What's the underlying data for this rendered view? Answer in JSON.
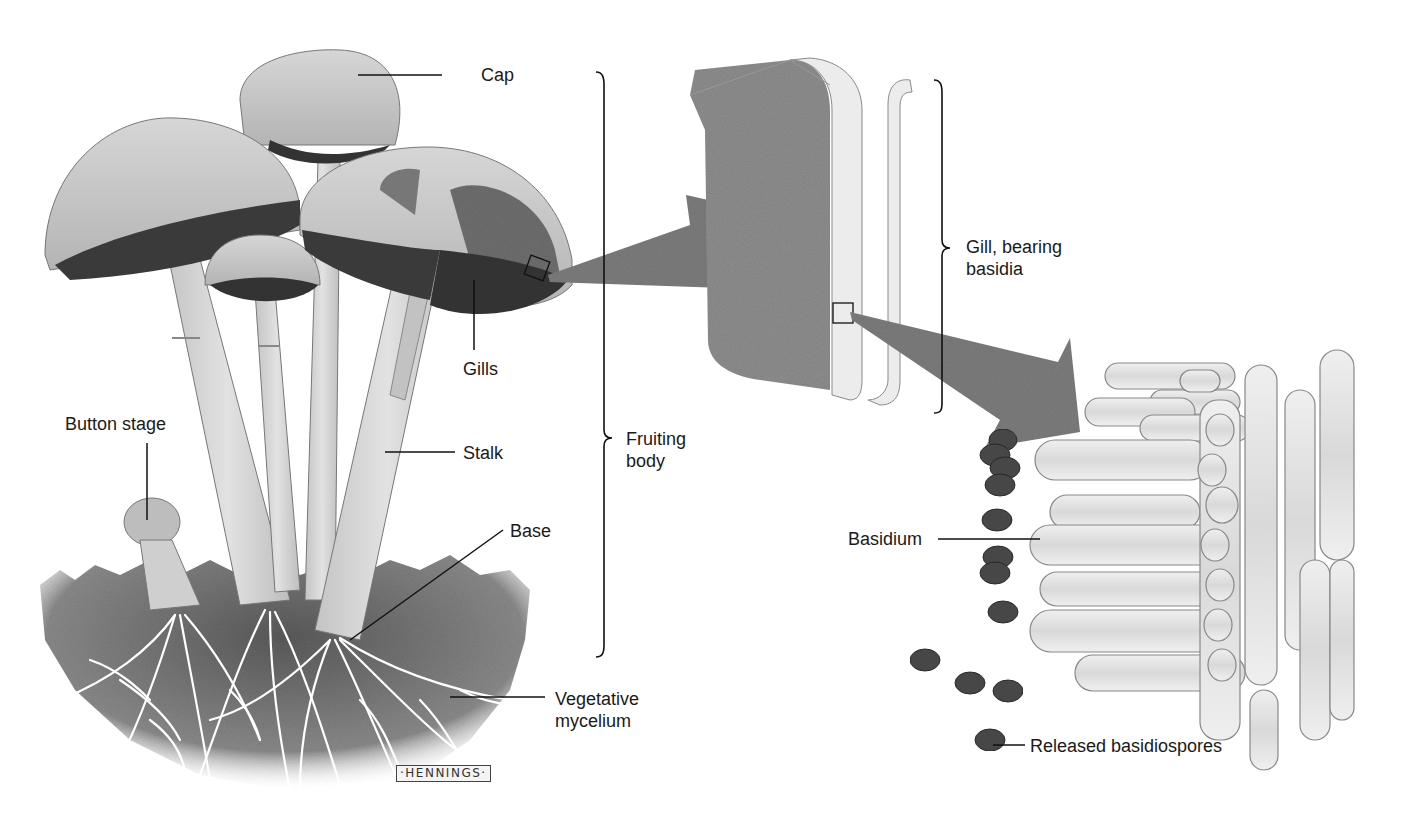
{
  "figure": {
    "colors": {
      "background": "#ffffff",
      "cap": "#c9c9c9",
      "cap_shadow": "#a8a8a8",
      "gills": "#3a3a3a",
      "stalk": "#d8d8d8",
      "soil": "#6e6e6e",
      "mycelium": "#ffffff",
      "arrow": "#7c7c7c",
      "gill_face": "#8d8d8d",
      "hyphae": "#e6e6e6",
      "spore": "#4a4a4a",
      "line": "#111111"
    }
  },
  "labels": {
    "cap": "Cap",
    "gills": "Gills",
    "stalk": "Stalk",
    "base": "Base",
    "button_stage": "Button stage",
    "vegetative_mycelium": "Vegetative\nmycelium",
    "fruiting_body": "Fruiting\nbody",
    "gill_bearing_basidia": "Gill, bearing\nbasidia",
    "basidium": "Basidium",
    "released_basidiospores": "Released basidiospores"
  },
  "signature": "·HENNINGS·"
}
